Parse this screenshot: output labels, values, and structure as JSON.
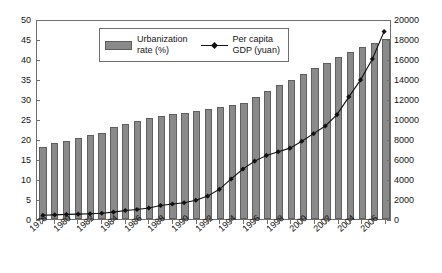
{
  "chart_data": {
    "type": "bar",
    "title": "",
    "subtitle": "",
    "xlabel": "",
    "ylabel": "",
    "grid": false,
    "legend_position": "top-center",
    "categories": [
      "1978",
      "1979",
      "1980",
      "1981",
      "1982",
      "1983",
      "1984",
      "1985",
      "1986",
      "1987",
      "1988",
      "1989",
      "1990",
      "1991",
      "1992",
      "1993",
      "1994",
      "1995",
      "1996",
      "1997",
      "1998",
      "1999",
      "2000",
      "2001",
      "2002",
      "2003",
      "2004",
      "2005",
      "2006",
      "2007"
    ],
    "x_tick_labels": [
      "1978",
      "1980",
      "1982",
      "1984",
      "1986",
      "1988",
      "1990",
      "1992",
      "1994",
      "1996",
      "1998",
      "2000",
      "2002",
      "2004",
      "2006"
    ],
    "left_axis": {
      "label": "Urbanization rate (%)",
      "ylim": [
        0,
        50
      ],
      "ticks": [
        0,
        5,
        10,
        15,
        20,
        25,
        30,
        35,
        40,
        45,
        50
      ]
    },
    "right_axis": {
      "label": "Per capita GDP (yuan)",
      "ylim": [
        0,
        20000
      ],
      "ticks": [
        0,
        2000,
        4000,
        6000,
        8000,
        10000,
        12000,
        14000,
        16000,
        18000,
        20000
      ]
    },
    "series": [
      {
        "name": "Urbanization rate (%)",
        "type": "bar",
        "axis": "left",
        "color": "#8a8a8a",
        "edge_color": "#5f5f5f",
        "values": [
          17.9,
          19.0,
          19.4,
          20.2,
          21.1,
          21.6,
          23.0,
          23.7,
          24.5,
          25.3,
          25.8,
          26.2,
          26.4,
          26.9,
          27.5,
          28.0,
          28.5,
          29.0,
          30.5,
          31.9,
          33.4,
          34.8,
          36.2,
          37.7,
          39.1,
          40.5,
          41.8,
          43.0,
          43.9,
          44.9
        ]
      },
      {
        "name": "Per capita GDP (yuan)",
        "type": "line",
        "axis": "right",
        "color": "#111111",
        "marker": "diamond",
        "values": [
          381,
          419,
          463,
          492,
          528,
          583,
          695,
          858,
          963,
          1112,
          1366,
          1519,
          1644,
          1893,
          2311,
          2998,
          4044,
          5046,
          5846,
          6420,
          6796,
          7159,
          7858,
          8622,
          9398,
          10542,
          12336,
          14053,
          16165,
          18934
        ]
      }
    ]
  },
  "legend": {
    "entries": [
      {
        "label": "Urbanization\nrate (%)",
        "symbol": "bar-swatch"
      },
      {
        "label": "Per capita\nGDP (yuan)",
        "symbol": "line-diamond-marker"
      }
    ]
  }
}
